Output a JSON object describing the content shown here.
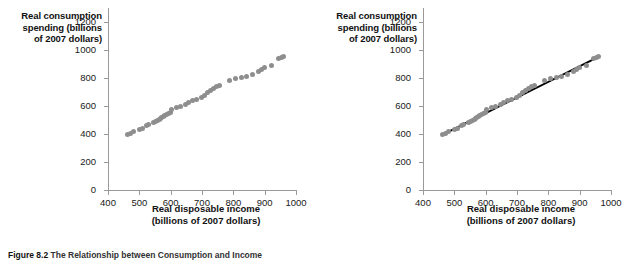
{
  "figure": {
    "caption_number": "Figure 8.2",
    "caption_text": "The Relationship between Consumption and Income"
  },
  "panels": [
    {
      "id": "left",
      "name": "scatter-without-trendline",
      "ylabel_lines": [
        "Real consumption",
        "spending (billions",
        "of 2007 dollars)"
      ],
      "xlabel_lines": [
        "Real disposable income",
        "(billions of 2007 dollars)"
      ],
      "show_trendline": false
    },
    {
      "id": "right",
      "name": "scatter-with-trendline",
      "ylabel_lines": [
        "Real consumption",
        "spending (billions",
        "of 2007 dollars)"
      ],
      "xlabel_lines": [
        "Real disposable income",
        "(billions of 2007 dollars)"
      ],
      "show_trendline": true
    }
  ],
  "axes": {
    "x_ticks": [
      400,
      500,
      600,
      700,
      800,
      900,
      1000
    ],
    "y_ticks": [
      0,
      200,
      400,
      600,
      800,
      1000,
      1200
    ],
    "xlim": [
      400,
      1000
    ],
    "ylim": [
      0,
      1300
    ]
  },
  "colors": {
    "dot": "#8e8e8e",
    "axis": "#9a9a9a",
    "trendline": "#000000",
    "text": "#111111",
    "background": "#ffffff"
  },
  "chart_data": {
    "type": "scatter",
    "title": "",
    "xlabel": "Real disposable income (billions of 2007 dollars)",
    "ylabel": "Real consumption spending (billions of 2007 dollars)",
    "xlim": [
      400,
      1000
    ],
    "ylim": [
      0,
      1300
    ],
    "xticks": [
      400,
      500,
      600,
      700,
      800,
      900,
      1000
    ],
    "yticks": [
      0,
      200,
      400,
      600,
      800,
      1000,
      1200
    ],
    "grid": false,
    "legend": null,
    "dot_color": "#8e8e8e",
    "points": [
      {
        "x": 463,
        "y": 398
      },
      {
        "x": 471,
        "y": 404
      },
      {
        "x": 481,
        "y": 416
      },
      {
        "x": 501,
        "y": 432
      },
      {
        "x": 510,
        "y": 437
      },
      {
        "x": 523,
        "y": 459
      },
      {
        "x": 529,
        "y": 466
      },
      {
        "x": 546,
        "y": 479
      },
      {
        "x": 552,
        "y": 489
      },
      {
        "x": 558,
        "y": 497
      },
      {
        "x": 563,
        "y": 503
      },
      {
        "x": 566,
        "y": 510
      },
      {
        "x": 572,
        "y": 517
      },
      {
        "x": 576,
        "y": 523
      },
      {
        "x": 581,
        "y": 530
      },
      {
        "x": 586,
        "y": 536
      },
      {
        "x": 593,
        "y": 546
      },
      {
        "x": 600,
        "y": 557
      },
      {
        "x": 604,
        "y": 572
      },
      {
        "x": 619,
        "y": 586
      },
      {
        "x": 632,
        "y": 598
      },
      {
        "x": 646,
        "y": 611
      },
      {
        "x": 658,
        "y": 622
      },
      {
        "x": 670,
        "y": 636
      },
      {
        "x": 683,
        "y": 650
      },
      {
        "x": 697,
        "y": 664
      },
      {
        "x": 709,
        "y": 677
      },
      {
        "x": 717,
        "y": 697
      },
      {
        "x": 727,
        "y": 708
      },
      {
        "x": 736,
        "y": 723
      },
      {
        "x": 747,
        "y": 736
      },
      {
        "x": 757,
        "y": 746
      },
      {
        "x": 789,
        "y": 782
      },
      {
        "x": 808,
        "y": 796
      },
      {
        "x": 826,
        "y": 805
      },
      {
        "x": 843,
        "y": 813
      },
      {
        "x": 862,
        "y": 824
      },
      {
        "x": 879,
        "y": 848
      },
      {
        "x": 889,
        "y": 862
      },
      {
        "x": 901,
        "y": 873
      },
      {
        "x": 921,
        "y": 890
      },
      {
        "x": 944,
        "y": 938
      },
      {
        "x": 955,
        "y": 948
      },
      {
        "x": 961,
        "y": 956
      }
    ],
    "trendline": {
      "color": "#000000",
      "x_start": 463,
      "y_start": 396,
      "x_end": 963,
      "y_end": 955
    }
  }
}
